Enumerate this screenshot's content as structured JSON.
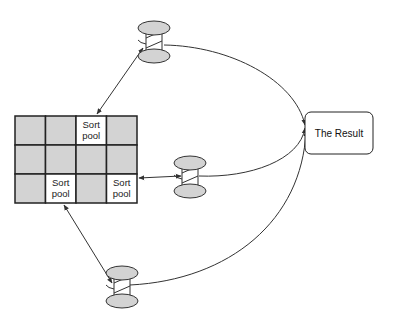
{
  "diagram": {
    "grid": {
      "rows": 3,
      "cols": 4,
      "x": 15,
      "y": 116,
      "cell_w": 30.5,
      "cell_h": 29,
      "fill_shaded": "#d3d3d3",
      "fill_sort_pool": "#ffffff",
      "sort_pool_cells": [
        {
          "row": 0,
          "col": 2,
          "line1": "Sort",
          "line2": "pool"
        },
        {
          "row": 2,
          "col": 1,
          "line1": "Sort",
          "line2": "pool"
        },
        {
          "row": 2,
          "col": 3,
          "line1": "Sort",
          "line2": "pool"
        }
      ]
    },
    "spools": [
      {
        "id": "spool-top",
        "cx": 154,
        "cy": 42
      },
      {
        "id": "spool-middle",
        "cx": 190,
        "cy": 177
      },
      {
        "id": "spool-bottom",
        "cx": 122,
        "cy": 287
      }
    ],
    "result_box": {
      "label": "The Result",
      "x": 305,
      "y": 112,
      "w": 68,
      "h": 42
    },
    "colors": {
      "line": "#333333",
      "spool_fill": "#d3d3d3",
      "border": "#222222"
    }
  }
}
